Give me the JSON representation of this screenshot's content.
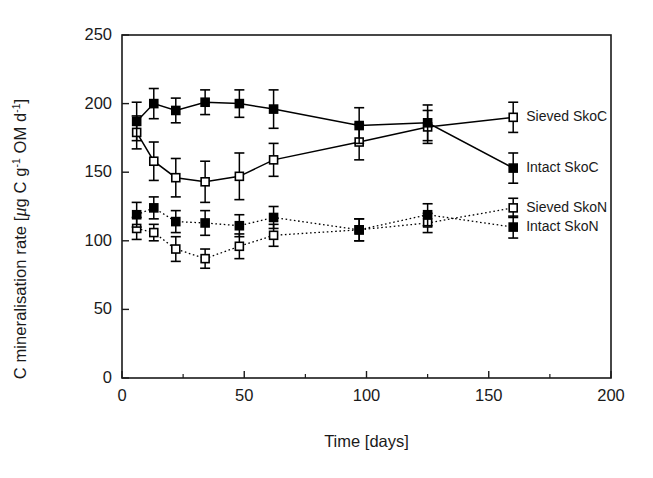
{
  "chart_data": {
    "type": "line",
    "title": "",
    "subtitle": "",
    "xlabel": "Time [days]",
    "ylabel": "C mineralisation rate [μg C g⁻¹ OM d⁻¹]",
    "ylabel_parts": {
      "prefix": "C mineralisation rate [",
      "mu": "μ",
      "main1": "g C g",
      "sup1": "-1",
      "main2": " OM d",
      "sup2": "-1",
      "suffix": "]"
    },
    "xlim": [
      0,
      200
    ],
    "ylim": [
      0,
      250
    ],
    "xticks": [
      0,
      50,
      100,
      150,
      200
    ],
    "xtick_labels": [
      "0",
      "50",
      "100",
      "150",
      "200"
    ],
    "x_minor_ticks": [
      25,
      75,
      125,
      175
    ],
    "yticks": [
      0,
      50,
      100,
      150,
      200,
      250
    ],
    "ytick_labels": [
      "0",
      "50",
      "100",
      "150",
      "200",
      "250"
    ],
    "grid": false,
    "legend_position": "right-inside",
    "error_bars": "standard deviation",
    "series": [
      {
        "name": "Sieved SkoC",
        "marker": "open-square",
        "line_style": "solid",
        "color": "#000000",
        "x": [
          6,
          13,
          22,
          34,
          48,
          62,
          97,
          125,
          160
        ],
        "values": [
          179,
          158,
          146,
          143,
          147,
          159,
          172,
          183,
          190
        ],
        "errors": [
          12,
          14,
          14,
          15,
          17,
          12,
          13,
          12,
          11
        ]
      },
      {
        "name": "Intact SkoC",
        "marker": "filled-square",
        "line_style": "solid",
        "color": "#000000",
        "x": [
          6,
          13,
          22,
          34,
          48,
          62,
          97,
          125,
          160
        ],
        "values": [
          187,
          200,
          195,
          201,
          200,
          196,
          184,
          186,
          153
        ],
        "errors": [
          14,
          11,
          9,
          9,
          10,
          14,
          13,
          13,
          11
        ]
      },
      {
        "name": "Sieved SkoN",
        "marker": "open-square",
        "line_style": "dotted",
        "color": "#000000",
        "x": [
          6,
          13,
          22,
          34,
          48,
          62,
          97,
          125,
          160
        ],
        "values": [
          109,
          106,
          94,
          87,
          96,
          104,
          108,
          113,
          124
        ],
        "errors": [
          8,
          6,
          9,
          7,
          9,
          8,
          8,
          7,
          7
        ]
      },
      {
        "name": "Intact SkoN",
        "marker": "filled-square",
        "line_style": "dotted",
        "color": "#000000",
        "x": [
          6,
          13,
          22,
          34,
          48,
          62,
          97,
          125,
          160
        ],
        "values": [
          119,
          124,
          114,
          113,
          111,
          117,
          108,
          119,
          110
        ],
        "errors": [
          9,
          8,
          8,
          9,
          8,
          8,
          8,
          8,
          8
        ]
      }
    ],
    "legend_entries": [
      {
        "label": "Sieved SkoC",
        "marker": "open-square",
        "line_style": "solid"
      },
      {
        "label": "Intact SkoC",
        "marker": "filled-square",
        "line_style": "solid"
      },
      {
        "label": "Sieved SkoN",
        "marker": "open-square",
        "line_style": "dotted"
      },
      {
        "label": "Intact SkoN",
        "marker": "filled-square",
        "line_style": "dotted"
      }
    ]
  }
}
